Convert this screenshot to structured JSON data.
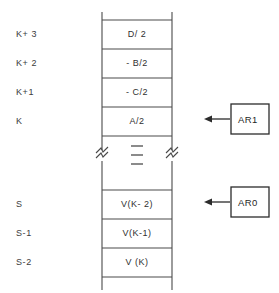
{
  "diagram": {
    "line_color": "#4a4a4a",
    "text_color": "#303030",
    "background": "#ffffff",
    "rows": [
      {
        "address": "K+ 3",
        "content": "D/ 2"
      },
      {
        "address": "K+ 2",
        "content": "- B/2"
      },
      {
        "address": "K+1",
        "content": "- C/2"
      },
      {
        "address": "K",
        "content": "A/2"
      },
      {
        "address": "",
        "content": ""
      },
      {
        "address": "S",
        "content": "V(K- 2)"
      },
      {
        "address": "S-1",
        "content": "V(K-1)"
      },
      {
        "address": "S-2",
        "content": "V  (K)"
      }
    ],
    "break_marks": {
      "name": "axis-break-symbol",
      "count": 2
    },
    "ellipsis": {
      "name": "vertical-ellipsis",
      "glyph": "—",
      "count": 3
    },
    "registers": [
      {
        "label": "AR1",
        "points_to": "K"
      },
      {
        "label": "AR0",
        "points_to": "S"
      }
    ]
  }
}
